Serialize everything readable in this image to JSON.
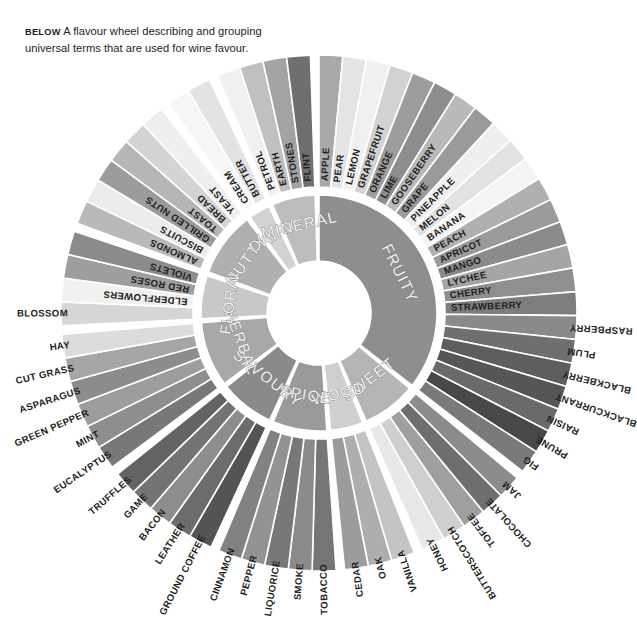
{
  "caption": {
    "lead": "BELOW",
    "text": "A flavour wheel describing and grouping universal terms that are used for wine favour."
  },
  "wheel": {
    "title": "wine-flavour-wheel",
    "center": [
      319,
      313
    ],
    "hub_radius": 52,
    "inner_ring": [
      118,
      52
    ],
    "outer_ring": [
      258,
      126
    ],
    "start_angle_deg": -90,
    "colors": {
      "background": "#ffffff",
      "separator": "#ffffff",
      "label": "#231f20",
      "category_label_fill": "#f2f2f2",
      "category_label_stroke": "#6d6d6d",
      "greys": [
        "#e9e9e9",
        "#d8d8d8",
        "#c6c6c6",
        "#b4b4b4",
        "#a2a2a2",
        "#909090",
        "#7e7e7e",
        "#6c6c6c",
        "#5a5a5a",
        "#4a4a4a",
        "#3c3c3c"
      ]
    }
  },
  "chart_data": {
    "type": "pie",
    "legend": "none",
    "categories": [
      "FRUITY",
      "SWEET",
      "WOOD",
      "SPICE",
      "SAVOURY",
      "HERBAL",
      "FLORAL",
      "NUTTY",
      "DAIRY",
      "MINERAL"
    ],
    "values": [
      24,
      6,
      3,
      5,
      5,
      6,
      4,
      6,
      2,
      4
    ],
    "groups": [
      {
        "name": "FRUITY",
        "shade": "#8e8e8e",
        "items": [
          {
            "label": "APPLE",
            "shade": "#a9a9a9"
          },
          {
            "label": "PEAR",
            "shade": "#e4e4e4"
          },
          {
            "label": "LEMON",
            "shade": "#f0f0f0"
          },
          {
            "label": "GRAPEFRUIT",
            "shade": "#d2d2d2"
          },
          {
            "label": "ORANGE",
            "shade": "#9d9d9d"
          },
          {
            "label": "LIME",
            "shade": "#8d8d8d"
          },
          {
            "label": "GOOSEBERRY",
            "shade": "#b9b9b9"
          },
          {
            "label": "GRAPE",
            "shade": "#9a9a9a"
          },
          {
            "label": "PINEAPPLE",
            "shade": "#efefef"
          },
          {
            "label": "MELON",
            "shade": "#e2e2e2"
          },
          {
            "label": "BANANA",
            "shade": "#f4f4f4"
          },
          {
            "label": "PEACH",
            "shade": "#b0b0b0"
          },
          {
            "label": "APRICOT",
            "shade": "#9b9b9b"
          },
          {
            "label": "MANGO",
            "shade": "#8b8b8b"
          },
          {
            "label": "LYCHEE",
            "shade": "#a5a5a5"
          },
          {
            "label": "CHERRY",
            "shade": "#8f8f8f"
          },
          {
            "label": "STRAWBERRY",
            "shade": "#7d7d7d"
          },
          {
            "label": "RASPBERRY",
            "shade": "#8a8a8a"
          },
          {
            "label": "PLUM",
            "shade": "#6f6f6f"
          },
          {
            "label": "BLACKBERRY",
            "shade": "#5e5e5e"
          },
          {
            "label": "BLACKCURRANT",
            "shade": "#565656"
          },
          {
            "label": "RAISIN",
            "shade": "#6a6a6a"
          },
          {
            "label": "PRUNE",
            "shade": "#484848"
          },
          {
            "label": "FIG",
            "shade": "#7a7a7a"
          }
        ]
      },
      {
        "name": "SWEET",
        "shade": "#b5b5b5",
        "items": [
          {
            "label": "JAM",
            "shade": "#8c8c8c"
          },
          {
            "label": "CHOCOLATE",
            "shade": "#6e6e6e"
          },
          {
            "label": "TOFFEE",
            "shade": "#9f9f9f"
          },
          {
            "label": "BUTTERSCOTCH",
            "shade": "#cfcfcf"
          },
          {
            "label": "HONEY",
            "shade": "#e8e8e8"
          }
        ]
      },
      {
        "name": "WOOD",
        "shade": "#cfcfcf",
        "items": [
          {
            "label": "VANILLA",
            "shade": "#c4c4c4"
          },
          {
            "label": "OAK",
            "shade": "#aeaeae"
          },
          {
            "label": "CEDAR",
            "shade": "#9c9c9c"
          }
        ]
      },
      {
        "name": "SPICE",
        "shade": "#9a9a9a",
        "items": [
          {
            "label": "TOBACCO",
            "shade": "#767676"
          },
          {
            "label": "SMOKE",
            "shade": "#8b8b8b"
          },
          {
            "label": "LIQUORICE",
            "shade": "#787878"
          },
          {
            "label": "PEPPER",
            "shade": "#939393"
          },
          {
            "label": "CINNAMON",
            "shade": "#828282"
          }
        ]
      },
      {
        "name": "SAVOURY",
        "shade": "#8a8a8a",
        "items": [
          {
            "label": "GROUND COFFEE",
            "shade": "#545454"
          },
          {
            "label": "LEATHER",
            "shade": "#6c6c6c"
          },
          {
            "label": "BACON",
            "shade": "#8d8d8d"
          },
          {
            "label": "GAME",
            "shade": "#737373"
          },
          {
            "label": "TRUFFLES",
            "shade": "#636363"
          }
        ]
      },
      {
        "name": "HERBAL",
        "shade": "#a8a8a8",
        "items": [
          {
            "label": "EUCALYPTUS",
            "shade": "#787878"
          },
          {
            "label": "MINT",
            "shade": "#8e8e8e"
          },
          {
            "label": "GREEN PEPPER",
            "shade": "#9d9d9d"
          },
          {
            "label": "ASPARAGUS",
            "shade": "#8c8c8c"
          },
          {
            "label": "CUT GRASS",
            "shade": "#a6a6a6"
          },
          {
            "label": "HAY",
            "shade": "#dcdcdc"
          }
        ]
      },
      {
        "name": "FLORAL",
        "shade": "#c8c8c8",
        "items": [
          {
            "label": "BLOSSOM",
            "shade": "#d6d6d6"
          },
          {
            "label": "ELDERFLOWERS",
            "shade": "#f1f1f1"
          },
          {
            "label": "RED ROSES",
            "shade": "#9e9e9e"
          },
          {
            "label": "VIOLETS",
            "shade": "#8b8b8b"
          }
        ]
      },
      {
        "name": "NUTTY",
        "shade": "#b0b0b0",
        "items": [
          {
            "label": "ALMONDS",
            "shade": "#b9b9b9"
          },
          {
            "label": "BISCUITS",
            "shade": "#ececec"
          },
          {
            "label": "GRILLED NUTS",
            "shade": "#9c9c9c"
          },
          {
            "label": "TOAST",
            "shade": "#b6b6b6"
          },
          {
            "label": "BREAD",
            "shade": "#d4d4d4"
          },
          {
            "label": "YEAST",
            "shade": "#efefef"
          }
        ]
      },
      {
        "name": "DAIRY",
        "shade": "#d2d2d2",
        "items": [
          {
            "label": "CREAM",
            "shade": "#f6f6f6"
          },
          {
            "label": "BUTTER",
            "shade": "#e3e3e3"
          }
        ]
      },
      {
        "name": "MINERAL",
        "shade": "#bdbdbd",
        "items": [
          {
            "label": "PETROL",
            "shade": "#f0f0f0"
          },
          {
            "label": "EARTH",
            "shade": "#c0c0c0"
          },
          {
            "label": "STONES",
            "shade": "#a3a3a3"
          },
          {
            "label": "FLINT",
            "shade": "#6f6f6f"
          }
        ]
      }
    ]
  }
}
